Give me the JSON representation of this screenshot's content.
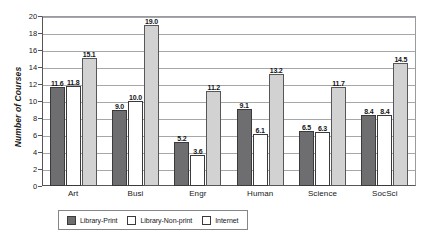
{
  "chart_data": {
    "type": "bar",
    "title": "",
    "xlabel": "",
    "ylabel": "Number of Courses",
    "ylim": [
      0,
      20
    ],
    "ytick_step": 2,
    "yticks": [
      "0",
      "2",
      "4",
      "6",
      "8",
      "10",
      "12",
      "14",
      "16",
      "18",
      "20"
    ],
    "grid": true,
    "legend_position": "bottom",
    "categories": [
      "Art",
      "Busi",
      "Engr",
      "Human",
      "Science",
      "SocSci"
    ],
    "series": [
      {
        "name": "Library-Print",
        "color": "#6e6e70",
        "values": [
          11.6,
          9.0,
          5.2,
          9.1,
          6.5,
          8.4
        ],
        "labels": [
          "11.6",
          "9.0",
          "5.2",
          "9.1",
          "6.5",
          "8.4"
        ]
      },
      {
        "name": "Library-Non-print",
        "color": "#ffffff",
        "values": [
          11.8,
          10.0,
          3.6,
          6.1,
          6.3,
          8.4
        ],
        "labels": [
          "11.8",
          "10.0",
          "3.6",
          "6.1",
          "6.3",
          "8.4"
        ]
      },
      {
        "name": "Internet",
        "color": "#d2d2d2",
        "values": [
          15.1,
          19.0,
          11.2,
          13.2,
          11.7,
          14.5
        ],
        "labels": [
          "15.1",
          "19.0",
          "11.2",
          "13.2",
          "11.7",
          "14.5"
        ]
      }
    ]
  }
}
